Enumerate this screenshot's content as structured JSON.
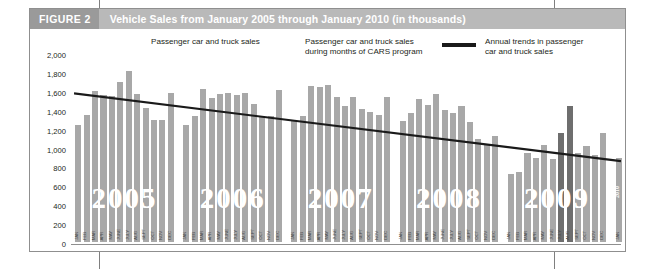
{
  "figure": {
    "number_label": "FIGURE 2",
    "title": "Vehicle Sales from January 2005 through January 2010 (in thousands)"
  },
  "legend": {
    "items": [
      {
        "name": "normal-sales-swatch",
        "label": "Passenger car and truck sales",
        "color": "#a8a8a8",
        "type": "swatch"
      },
      {
        "name": "cars-program-swatch",
        "label": "Passenger car and truck sales\nduring months of CARS program",
        "color": "#6e6e6e",
        "type": "swatch"
      },
      {
        "name": "trend-line-sample",
        "label": "Annual trends in passenger\ncar and truck sales",
        "color": "#1a1a1a",
        "type": "line"
      }
    ]
  },
  "chart_data": {
    "type": "bar",
    "title": "Vehicle Sales from January 2005 through January 2010 (in thousands)",
    "xlabel": "",
    "ylabel": "",
    "ylim": [
      0,
      2000
    ],
    "yticks": [
      "0",
      "200",
      "400",
      "600",
      "800",
      "1,000",
      "1,200",
      "1,400",
      "1,600",
      "1,800",
      "2,000"
    ],
    "grid": false,
    "legend_position": "top",
    "months": [
      "JAN",
      "FEB",
      "MAR",
      "APR",
      "MAY",
      "JUNE",
      "JULY",
      "AUG",
      "SEPT",
      "OCT",
      "NOV",
      "DEC"
    ],
    "years": [
      {
        "year": "2005",
        "values": [
          1237,
          1345,
          1596,
          1555,
          1550,
          1692,
          1812,
          1565,
          1421,
          1289,
          1292,
          1581
        ],
        "cars_months": []
      },
      {
        "year": "2006",
        "values": [
          1240,
          1335,
          1618,
          1525,
          1565,
          1573,
          1560,
          1575,
          1457,
          1337,
          1331,
          1605
        ],
        "cars_months": []
      },
      {
        "year": "2007",
        "values": [
          1276,
          1336,
          1648,
          1637,
          1659,
          1532,
          1443,
          1533,
          1406,
          1372,
          1345,
          1532
        ],
        "cars_months": []
      },
      {
        "year": "2008",
        "values": [
          1282,
          1360,
          1511,
          1449,
          1566,
          1396,
          1366,
          1442,
          1270,
          1086,
          1040,
          1124
        ],
        "cars_months": []
      },
      {
        "year": "2009",
        "values": [
          720,
          736,
          937,
          893,
          1030,
          875,
          1152,
          1443,
          938,
          1015,
          921,
          1156
        ],
        "cars_months": [
          "JULY",
          "AUG"
        ]
      },
      {
        "year": "2010",
        "values": [
          885
        ],
        "cars_months": []
      }
    ],
    "trend_line": {
      "label": "Annual trends in passenger car and truck sales",
      "start_value": 1590,
      "end_value": 870
    }
  }
}
